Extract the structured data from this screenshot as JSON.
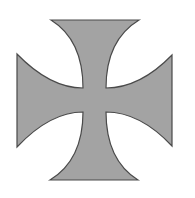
{
  "image": {
    "subject": "Cross pattée",
    "background": "#ffffff",
    "fill": "#a3a3a3",
    "stroke": "#4a4a4a"
  },
  "shape": {
    "top_arm": {
      "outer_left": 51,
      "outer_right": 139,
      "outer_y": 20
    },
    "bottom_arm": {
      "outer_left": 50,
      "outer_right": 138,
      "outer_y": 180
    },
    "left_arm": {
      "outer_x": 17,
      "outer_top": 54,
      "outer_bottom": 147
    },
    "right_arm": {
      "outer_x": 172,
      "outer_top": 55,
      "outer_bottom": 146
    },
    "center": {
      "left": 83,
      "right": 106,
      "top": 88,
      "bottom": 112
    }
  }
}
